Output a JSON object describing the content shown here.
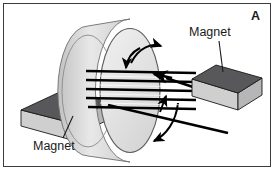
{
  "figure": {
    "panel_letter": "A",
    "background_color": "#ffffff",
    "border_color": "#3c3c3c",
    "width": 275,
    "height": 171
  },
  "labels": {
    "magnet_right": "Magnet",
    "magnet_left": "Magnet"
  },
  "diagram": {
    "type": "electric-generator-armature",
    "colors": {
      "magnet_top_face": "#58585a",
      "magnet_front_face": "#cfcfcf",
      "magnet_side_face": "#a8a8a8",
      "cylinder_face": "#e2e2e2",
      "cylinder_rim": "#cbcbcb",
      "coil_wire": "#000000",
      "outline": "#1a1a1a",
      "leader_line": "#1a1a1a"
    },
    "parts": {
      "rotating_cylinder": "armature-disc",
      "coil_winding_count": 5,
      "rotation_arrows": 2,
      "lead_wires": 2,
      "magnets": 2
    }
  }
}
